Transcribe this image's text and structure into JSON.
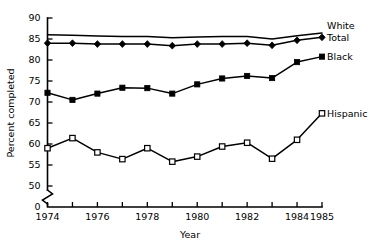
{
  "chart_data": {
    "type": "line",
    "title": "",
    "xlabel": "Year",
    "ylabel": "Percent completed",
    "x": [
      1974,
      1975,
      1976,
      1977,
      1978,
      1979,
      1980,
      1981,
      1982,
      1983,
      1984,
      1985
    ],
    "xlim": [
      1974,
      1985
    ],
    "ylim": [
      50,
      90
    ],
    "y_axis_break": true,
    "y_axis_break_label": "0",
    "grid": false,
    "legend_position": "right-inline",
    "xticks": [
      1974,
      1975,
      1976,
      1977,
      1978,
      1979,
      1980,
      1981,
      1982,
      1983,
      1984,
      1985
    ],
    "xticklabels": [
      "1974",
      "",
      "1976",
      "",
      "1978",
      "",
      "1980",
      "",
      "1982",
      "",
      "1984",
      "1985"
    ],
    "yticks": [
      50,
      55,
      60,
      65,
      70,
      75,
      80,
      85,
      90
    ],
    "yticklabels": [
      "50",
      "55",
      "60",
      "65",
      "70",
      "75",
      "80",
      "85",
      "90"
    ],
    "series": [
      {
        "name": "White",
        "marker": "none",
        "values": [
          86.0,
          85.9,
          85.7,
          85.6,
          85.6,
          85.3,
          85.5,
          85.6,
          85.6,
          85.0,
          85.8,
          86.4
        ]
      },
      {
        "name": "Total",
        "marker": "filled-diamond",
        "values": [
          84.0,
          84.0,
          83.8,
          83.8,
          83.8,
          83.4,
          83.8,
          83.8,
          84.0,
          83.5,
          84.7,
          85.4
        ]
      },
      {
        "name": "Black",
        "marker": "filled-square",
        "values": [
          72.2,
          70.5,
          72.0,
          73.4,
          73.3,
          72.0,
          74.2,
          75.6,
          76.2,
          75.7,
          79.5,
          80.8
        ]
      },
      {
        "name": "Hispanic",
        "marker": "open-square",
        "values": [
          59.0,
          61.4,
          58.0,
          56.4,
          59.0,
          55.8,
          57.0,
          59.4,
          60.3,
          56.5,
          61.0,
          67.3
        ]
      }
    ]
  },
  "axis": {
    "x_title": "Year",
    "y_title": "Percent completed",
    "zero_label": "0"
  },
  "legend": {
    "items": [
      {
        "label": "White"
      },
      {
        "label": "Total"
      },
      {
        "label": "Black"
      },
      {
        "label": "Hispanic"
      }
    ]
  }
}
